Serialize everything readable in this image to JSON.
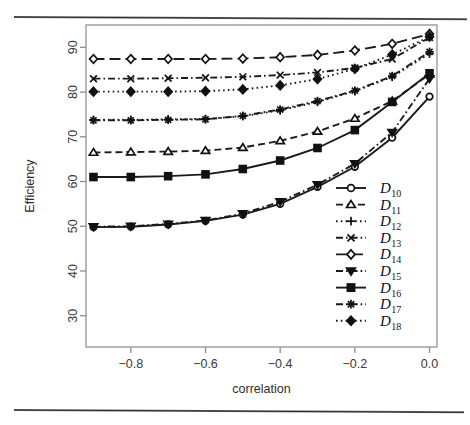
{
  "figure": {
    "top_rule": "horizontal-rule",
    "bottom_rule": "horizontal-rule"
  },
  "chart_data": {
    "type": "line",
    "title": "",
    "xlabel": "correlation",
    "ylabel": "Efficiency",
    "xlim": [
      -0.92,
      0.02
    ],
    "ylim": [
      23,
      95
    ],
    "grid": false,
    "legend_position": "bottom-right",
    "xticks": [
      -0.8,
      -0.6,
      -0.4,
      -0.2,
      0.0
    ],
    "xticklabels": [
      "−0.8",
      "−0.6",
      "−0.4",
      "−0.2",
      "0.0"
    ],
    "yticks": [
      30,
      40,
      50,
      60,
      70,
      80,
      90
    ],
    "yticklabels": [
      "30",
      "40",
      "50",
      "60",
      "70",
      "80",
      "90"
    ],
    "x": [
      -0.9,
      -0.8,
      -0.7,
      -0.6,
      -0.5,
      -0.4,
      -0.3,
      -0.2,
      -0.1,
      0.0
    ],
    "series": [
      {
        "name": "D10",
        "label": "D",
        "sub": "10",
        "marker": "circle-open",
        "dash": "solid",
        "values": [
          49.8,
          49.9,
          50.4,
          51.2,
          52.6,
          55.0,
          58.8,
          63.3,
          69.8,
          79.0
        ]
      },
      {
        "name": "D11",
        "label": "D",
        "sub": "11",
        "marker": "triangle-up-open",
        "dash": "dashed",
        "values": [
          66.5,
          66.6,
          66.7,
          66.9,
          67.6,
          69.1,
          71.2,
          74.1,
          78.0,
          84.0
        ]
      },
      {
        "name": "D12",
        "label": "D",
        "sub": "12",
        "marker": "plus",
        "dash": "dotted",
        "values": [
          73.8,
          73.8,
          73.9,
          74.0,
          74.6,
          75.9,
          77.8,
          80.2,
          83.4,
          88.6
        ]
      },
      {
        "name": "D13",
        "label": "D",
        "sub": "13",
        "marker": "x-cross",
        "dash": "dashdot",
        "values": [
          83.0,
          83.0,
          83.1,
          83.2,
          83.4,
          83.8,
          84.4,
          85.4,
          87.4,
          92.2
        ]
      },
      {
        "name": "D14",
        "label": "D",
        "sub": "14",
        "marker": "diamond-open",
        "dash": "longdash",
        "values": [
          87.4,
          87.4,
          87.4,
          87.4,
          87.5,
          87.8,
          88.3,
          89.3,
          90.8,
          93.0
        ]
      },
      {
        "name": "D15",
        "label": "D",
        "sub": "15",
        "marker": "triangle-down-fill",
        "dash": "dashdot",
        "values": [
          49.9,
          50.0,
          50.5,
          51.3,
          52.8,
          55.5,
          59.3,
          64.0,
          71.0,
          83.0
        ]
      },
      {
        "name": "D16",
        "label": "D",
        "sub": "16",
        "marker": "square-fill",
        "dash": "solid",
        "values": [
          61.0,
          61.0,
          61.2,
          61.6,
          62.8,
          64.7,
          67.5,
          71.5,
          77.8,
          84.2
        ]
      },
      {
        "name": "D17",
        "label": "D",
        "sub": "17",
        "marker": "asterisk",
        "dash": "dashdot",
        "values": [
          73.7,
          73.7,
          73.8,
          73.9,
          74.7,
          76.1,
          78.0,
          80.3,
          83.6,
          89.0
        ]
      },
      {
        "name": "D18",
        "label": "D",
        "sub": "18",
        "marker": "diamond-fill",
        "dash": "dotted",
        "values": [
          80.1,
          80.1,
          80.1,
          80.2,
          80.6,
          81.5,
          82.9,
          85.2,
          88.4,
          92.4
        ]
      }
    ]
  }
}
